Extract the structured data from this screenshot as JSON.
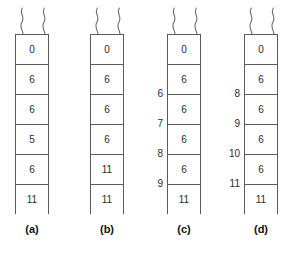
{
  "figure": {
    "type": "diagram",
    "background_color": "#ffffff",
    "border_color": "#5a5a5a",
    "text_color": "#2b2b2b",
    "break_marker_icon": "wavy-break-icon",
    "columns": [
      {
        "caption": "(a)",
        "cells": [
          {
            "value": "0",
            "index_label": ""
          },
          {
            "value": "6",
            "index_label": ""
          },
          {
            "value": "6",
            "index_label": ""
          },
          {
            "value": "5",
            "index_label": ""
          },
          {
            "value": "6",
            "index_label": ""
          },
          {
            "value": "11",
            "index_label": ""
          }
        ]
      },
      {
        "caption": "(b)",
        "cells": [
          {
            "value": "0",
            "index_label": ""
          },
          {
            "value": "6",
            "index_label": ""
          },
          {
            "value": "6",
            "index_label": ""
          },
          {
            "value": "6",
            "index_label": ""
          },
          {
            "value": "11",
            "index_label": ""
          },
          {
            "value": "11",
            "index_label": ""
          }
        ]
      },
      {
        "caption": "(c)",
        "cells": [
          {
            "value": "0",
            "index_label": ""
          },
          {
            "value": "6",
            "index_label": "6"
          },
          {
            "value": "6",
            "index_label": "7"
          },
          {
            "value": "6",
            "index_label": "8"
          },
          {
            "value": "6",
            "index_label": "9"
          },
          {
            "value": "11",
            "index_label": ""
          }
        ]
      },
      {
        "caption": "(d)",
        "cells": [
          {
            "value": "0",
            "index_label": ""
          },
          {
            "value": "6",
            "index_label": "8"
          },
          {
            "value": "6",
            "index_label": "9"
          },
          {
            "value": "6",
            "index_label": "10"
          },
          {
            "value": "6",
            "index_label": "11"
          },
          {
            "value": "11",
            "index_label": ""
          }
        ]
      }
    ]
  }
}
